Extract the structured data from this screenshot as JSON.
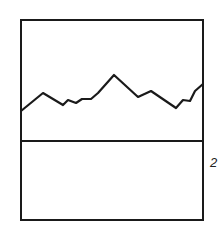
{
  "figure": {
    "reference_label": "2",
    "stroke_color": "#1a1a1a",
    "frame": {
      "x": 21,
      "y": 20,
      "width": 182,
      "height": 200
    },
    "divider_y": 141,
    "waveform_points": [
      [
        21,
        111
      ],
      [
        43,
        93
      ],
      [
        63,
        105
      ],
      [
        68,
        100
      ],
      [
        76,
        103
      ],
      [
        82,
        99
      ],
      [
        91,
        99
      ],
      [
        98,
        93
      ],
      [
        114,
        75
      ],
      [
        138,
        97
      ],
      [
        151,
        91
      ],
      [
        176,
        108
      ],
      [
        183,
        100
      ],
      [
        190,
        101
      ],
      [
        195,
        91
      ],
      [
        203,
        84
      ]
    ]
  }
}
